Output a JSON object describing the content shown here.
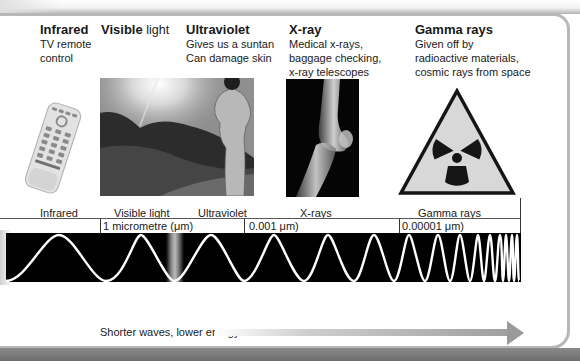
{
  "categories": [
    {
      "id": "infrared",
      "heading_bold": "Infrared",
      "heading_light": "",
      "description_lines": [
        "TV remote",
        "control"
      ],
      "image": "tv-remote-control"
    },
    {
      "id": "visible",
      "heading_bold": "Visible",
      "heading_light": "light",
      "description_lines": [],
      "image": "sunlit-landscape"
    },
    {
      "id": "ultraviolet",
      "heading_bold": "Ultraviolet",
      "heading_light": "",
      "description_lines": [
        "Gives us a suntan",
        "Can damage skin"
      ],
      "image": "sunbather-figure"
    },
    {
      "id": "xray",
      "heading_bold": "X-ray",
      "heading_light": "",
      "description_lines": [
        "Medical x-rays,",
        "baggage checking,",
        "x-ray telescopes"
      ],
      "image": "knee-x-ray"
    },
    {
      "id": "gamma",
      "heading_bold": "Gamma rays",
      "heading_light": "",
      "description_lines": [
        "Given off by",
        "radioactive materials,",
        "cosmic rays from space"
      ],
      "image": "radiation-hazard-sign"
    }
  ],
  "scale": {
    "band_labels": [
      "Infrared",
      "Visible light",
      "Ultraviolet",
      "X-rays",
      "Gamma rays"
    ],
    "wavelength_markers": [
      {
        "label": "1 micrometre (μm)"
      },
      {
        "label": "0.001 μm)"
      },
      {
        "label": "0.00001 μm)"
      }
    ]
  },
  "caption": "Shorter waves, lower energy",
  "colors": {
    "wave_background": "#000000",
    "wave_line": "#ffffff",
    "arrow": "#9a9a9a",
    "frame": "#b7b7b7"
  }
}
